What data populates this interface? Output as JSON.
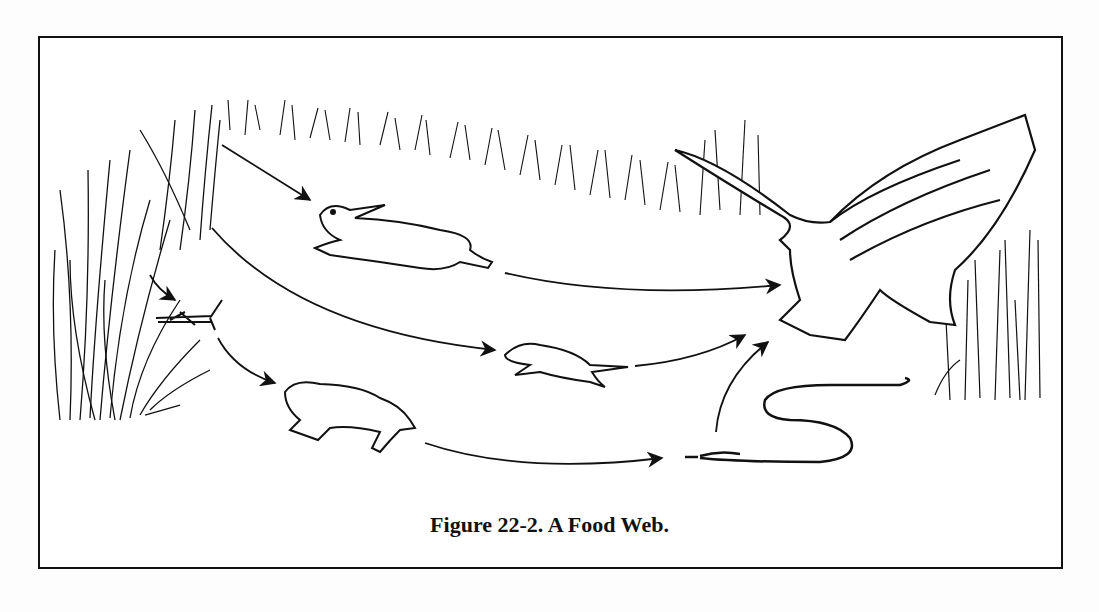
{
  "figure": {
    "caption": "Figure 22-2.  A Food Web.",
    "organisms": [
      {
        "id": "grass",
        "label": "Grass"
      },
      {
        "id": "rabbit",
        "label": "Rabbit"
      },
      {
        "id": "grasshopper",
        "label": "Grasshopper"
      },
      {
        "id": "mouse",
        "label": "Mouse"
      },
      {
        "id": "frog",
        "label": "Frog"
      },
      {
        "id": "snake",
        "label": "Snake"
      },
      {
        "id": "hawk",
        "label": "Hawk"
      }
    ],
    "arrows": [
      {
        "from": "grass",
        "to": "rabbit"
      },
      {
        "from": "grass",
        "to": "mouse"
      },
      {
        "from": "grass",
        "to": "grasshopper"
      },
      {
        "from": "grasshopper",
        "to": "frog"
      },
      {
        "from": "frog",
        "to": "snake"
      },
      {
        "from": "rabbit",
        "to": "hawk"
      },
      {
        "from": "mouse",
        "to": "hawk"
      },
      {
        "from": "snake",
        "to": "hawk"
      }
    ],
    "colors": {
      "ink": "#111111",
      "paper": "#ffffff"
    }
  }
}
